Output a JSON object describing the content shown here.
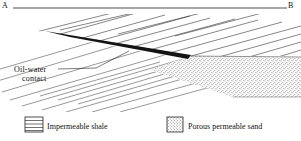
{
  "figure": {
    "type": "geologic-cross-section",
    "datum_line": {
      "left_label": "A",
      "right_label": "B",
      "x_start": 13,
      "x_end": 287,
      "y": 8
    },
    "annotation": {
      "name": "oil-water-contact",
      "line1": "Oil-water",
      "line2": "contact",
      "leader_from": [
        96,
        68
      ],
      "leader_to": [
        128,
        51
      ]
    },
    "units": [
      {
        "name": "impermeable-shale",
        "pattern": "diagonal-hatch",
        "color": "#000000"
      },
      {
        "name": "oil-accumulation",
        "pattern": "solid-fill",
        "color": "#111111"
      },
      {
        "name": "porous-permeable-sand",
        "pattern": "stipple",
        "color": "#000000"
      }
    ]
  },
  "legend": {
    "items": [
      {
        "swatch": "horizontal-lines",
        "label": "Impermeable shale"
      },
      {
        "swatch": "stipple-dots",
        "label": "Porous permeable sand"
      }
    ]
  },
  "colors": {
    "ink": "#111111",
    "background": "#ffffff",
    "oil_fill": "#141414"
  }
}
